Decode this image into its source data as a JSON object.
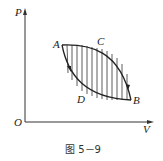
{
  "figure": {
    "caption": "图 5－9",
    "axes": {
      "y_label": "P",
      "x_label": "V",
      "origin_label": "O"
    },
    "points": [
      {
        "name": "A",
        "label": "A"
      },
      {
        "name": "C",
        "label": "C"
      },
      {
        "name": "B",
        "label": "B"
      },
      {
        "name": "D",
        "label": "D"
      }
    ]
  },
  "colors": {
    "ink": "#222222",
    "background": "#ffffff"
  }
}
